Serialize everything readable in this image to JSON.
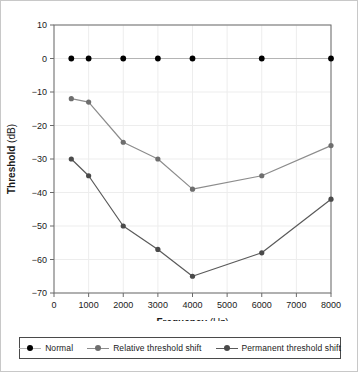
{
  "chart_data": {
    "type": "line",
    "title": "",
    "xlabel": "Frequency (Hz)",
    "xlabel_bold_part": "Frequency",
    "xlabel_plain_part": " (Hz)",
    "ylabel": "Threshold (dB)",
    "ylabel_bold_part": "Threshold",
    "ylabel_plain_part": " (dB)",
    "x": [
      500,
      1000,
      2000,
      3000,
      4000,
      6000,
      8000
    ],
    "xlim": [
      0,
      8000
    ],
    "ylim": [
      -70,
      10
    ],
    "xticks": [
      0,
      1000,
      2000,
      3000,
      4000,
      5000,
      6000,
      7000,
      8000
    ],
    "xtick_labels": [
      "0",
      "1000",
      "2000",
      "3000",
      "4000",
      "5000",
      "6000",
      "7000",
      "8000"
    ],
    "yticks": [
      10,
      0,
      -10,
      -20,
      -30,
      -40,
      -50,
      -60,
      -70
    ],
    "ytick_labels": [
      "10",
      "0",
      "−10",
      "−20",
      "−30",
      "−40",
      "−50",
      "−60",
      "−70"
    ],
    "grid": true,
    "legend_position": "below-outside",
    "series": [
      {
        "name": "Normal",
        "values": [
          0,
          0,
          0,
          0,
          0,
          0,
          0
        ],
        "line_color": "#b4b4b4",
        "marker_color": "#000000"
      },
      {
        "name": "Relative threshold shift",
        "values": [
          -12,
          -13,
          -25,
          -30,
          -39,
          -35,
          -26
        ],
        "line_color": "#8c8c8c",
        "marker_color": "#6e6e6e"
      },
      {
        "name": "Permanent threshold shift",
        "values": [
          -30,
          -35,
          -50,
          -57,
          -65,
          -58,
          -42
        ],
        "line_color": "#5a5a5a",
        "marker_color": "#4a4a4a"
      }
    ]
  },
  "legend": {
    "entries": [
      {
        "label": "Normal"
      },
      {
        "label": "Relative threshold shift"
      },
      {
        "label": "Permanent threshold shift"
      }
    ]
  },
  "colors": {
    "axis": "#6a6a6a",
    "grid": "#ededed",
    "text": "#1a1a1a",
    "frame": "#c8c8c8"
  }
}
